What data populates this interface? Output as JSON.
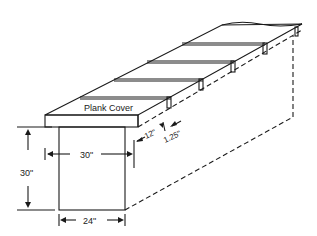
{
  "diagram": {
    "labels": {
      "plank_cover": "Plank Cover",
      "width_top": "30\"",
      "height": "30\"",
      "width_bottom": "24\"",
      "spacing": "12\"",
      "gap": "1.25\""
    },
    "colors": {
      "stroke": "#1a1a1a",
      "background": "#ffffff"
    }
  }
}
